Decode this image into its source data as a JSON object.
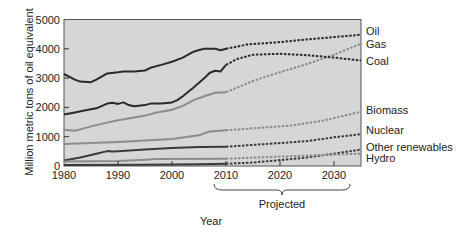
{
  "chart_data": {
    "type": "line",
    "title": "",
    "xlabel": "Year",
    "ylabel": "Million metric tons of oil equivalent",
    "xlim": [
      1980,
      2035
    ],
    "ylim": [
      0,
      5000
    ],
    "x_ticks": [
      1980,
      1990,
      2000,
      2010,
      2020,
      2030
    ],
    "y_ticks": [
      0,
      1000,
      2000,
      3000,
      4000,
      5000
    ],
    "grid": false,
    "legend_position": "right (direct labels)",
    "annotation": {
      "text": "Projected",
      "x_range": [
        2010,
        2035
      ]
    },
    "projection_start": 2010,
    "plot_background": "#d6d6d6",
    "series": [
      {
        "name": "Oil",
        "color": "#2a2a2a",
        "width": 2,
        "historical": [
          [
            1980,
            3140
          ],
          [
            1982,
            2950
          ],
          [
            1983,
            2880
          ],
          [
            1985,
            2860
          ],
          [
            1986,
            2950
          ],
          [
            1988,
            3160
          ],
          [
            1990,
            3200
          ],
          [
            1991,
            3230
          ],
          [
            1993,
            3230
          ],
          [
            1995,
            3260
          ],
          [
            1996,
            3350
          ],
          [
            1998,
            3450
          ],
          [
            2000,
            3560
          ],
          [
            2002,
            3700
          ],
          [
            2004,
            3900
          ],
          [
            2005,
            3960
          ],
          [
            2006,
            4000
          ],
          [
            2008,
            4000
          ],
          [
            2009,
            3950
          ],
          [
            2010,
            4000
          ]
        ],
        "projected": [
          [
            2010,
            4000
          ],
          [
            2014,
            4150
          ],
          [
            2020,
            4230
          ],
          [
            2025,
            4320
          ],
          [
            2030,
            4400
          ],
          [
            2035,
            4480
          ]
        ],
        "label_y": 4600
      },
      {
        "name": "Gas",
        "color": "#8c8c8c",
        "width": 2,
        "historical": [
          [
            1980,
            1240
          ],
          [
            1982,
            1200
          ],
          [
            1983,
            1250
          ],
          [
            1985,
            1350
          ],
          [
            1988,
            1480
          ],
          [
            1990,
            1560
          ],
          [
            1993,
            1660
          ],
          [
            1995,
            1720
          ],
          [
            1997,
            1820
          ],
          [
            2000,
            1920
          ],
          [
            2002,
            2050
          ],
          [
            2004,
            2250
          ],
          [
            2006,
            2380
          ],
          [
            2008,
            2500
          ],
          [
            2010,
            2520
          ]
        ],
        "projected": [
          [
            2010,
            2520
          ],
          [
            2015,
            2900
          ],
          [
            2020,
            3200
          ],
          [
            2025,
            3480
          ],
          [
            2030,
            3800
          ],
          [
            2035,
            4170
          ]
        ],
        "label_y": 4150
      },
      {
        "name": "Coal",
        "color": "#2a2a2a",
        "width": 2,
        "historical": [
          [
            1980,
            1760
          ],
          [
            1982,
            1830
          ],
          [
            1984,
            1900
          ],
          [
            1986,
            1970
          ],
          [
            1988,
            2130
          ],
          [
            1989,
            2160
          ],
          [
            1990,
            2120
          ],
          [
            1991,
            2170
          ],
          [
            1992,
            2080
          ],
          [
            1993,
            2040
          ],
          [
            1995,
            2080
          ],
          [
            1996,
            2130
          ],
          [
            1998,
            2130
          ],
          [
            2000,
            2170
          ],
          [
            2001,
            2250
          ],
          [
            2002,
            2380
          ],
          [
            2004,
            2680
          ],
          [
            2006,
            3000
          ],
          [
            2007,
            3180
          ],
          [
            2008,
            3250
          ],
          [
            2009,
            3230
          ],
          [
            2010,
            3450
          ]
        ],
        "projected": [
          [
            2010,
            3450
          ],
          [
            2012,
            3650
          ],
          [
            2015,
            3800
          ],
          [
            2020,
            3830
          ],
          [
            2025,
            3780
          ],
          [
            2030,
            3700
          ],
          [
            2035,
            3600
          ]
        ],
        "label_y": 3600
      },
      {
        "name": "Biomass",
        "color": "#8c8c8c",
        "width": 2,
        "historical": [
          [
            1980,
            750
          ],
          [
            1990,
            820
          ],
          [
            2000,
            920
          ],
          [
            2005,
            1050
          ],
          [
            2007,
            1180
          ],
          [
            2010,
            1220
          ]
        ],
        "projected": [
          [
            2010,
            1220
          ],
          [
            2016,
            1300
          ],
          [
            2022,
            1380
          ],
          [
            2028,
            1550
          ],
          [
            2035,
            1850
          ]
        ],
        "label_y": 1900
      },
      {
        "name": "Nuclear",
        "color": "#3a3a3a",
        "width": 2,
        "historical": [
          [
            1980,
            190
          ],
          [
            1983,
            290
          ],
          [
            1986,
            420
          ],
          [
            1988,
            510
          ],
          [
            1989,
            490
          ],
          [
            1990,
            500
          ],
          [
            1995,
            560
          ],
          [
            2000,
            610
          ],
          [
            2005,
            650
          ],
          [
            2010,
            660
          ]
        ],
        "projected": [
          [
            2010,
            660
          ],
          [
            2015,
            720
          ],
          [
            2020,
            780
          ],
          [
            2025,
            850
          ],
          [
            2030,
            980
          ],
          [
            2035,
            1090
          ]
        ],
        "label_y": 1220
      },
      {
        "name": "Other renewables",
        "color": "#3a3a3a",
        "width": 2,
        "historical": [
          [
            1980,
            30
          ],
          [
            1995,
            40
          ],
          [
            2005,
            60
          ],
          [
            2010,
            80
          ]
        ],
        "projected": [
          [
            2010,
            80
          ],
          [
            2015,
            120
          ],
          [
            2020,
            200
          ],
          [
            2025,
            290
          ],
          [
            2030,
            420
          ],
          [
            2035,
            560
          ]
        ],
        "label_y": 660
      },
      {
        "name": "Hydro",
        "color": "#8c8c8c",
        "width": 2,
        "historical": [
          [
            1980,
            150
          ],
          [
            1990,
            170
          ],
          [
            1995,
            210
          ],
          [
            1997,
            240
          ],
          [
            2010,
            250
          ]
        ],
        "projected": [
          [
            2010,
            250
          ],
          [
            2020,
            320
          ],
          [
            2030,
            390
          ],
          [
            2035,
            420
          ]
        ],
        "label_y": 260
      }
    ]
  }
}
